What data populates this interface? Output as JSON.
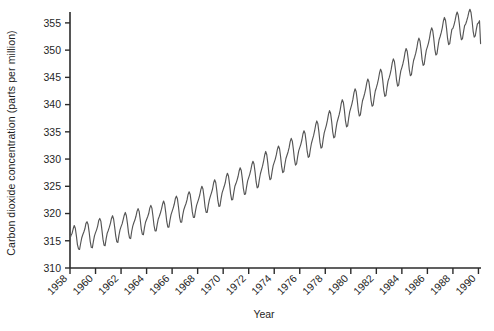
{
  "chart_data": {
    "type": "line",
    "title": "",
    "xlabel": "Year",
    "ylabel": "Carbon dioxide concentration (parts per million)",
    "xlim": [
      1958,
      1990.2
    ],
    "ylim": [
      310,
      357
    ],
    "grid": false,
    "legend": "none",
    "line_color": "#555555",
    "axis_color": "#2b2b2b",
    "background": "#ffffff",
    "ytick_labels": [
      "310",
      "315",
      "320",
      "325",
      "330",
      "335",
      "340",
      "345",
      "350",
      "355"
    ],
    "ytick_values": [
      310,
      315,
      320,
      325,
      330,
      335,
      340,
      345,
      350,
      355
    ],
    "xtick_labels": [
      "1958",
      "1960",
      "1962",
      "1964",
      "1966",
      "1968",
      "1970",
      "1972",
      "1974",
      "1976",
      "1978",
      "1980",
      "1982",
      "1984",
      "1986",
      "1988",
      "1990"
    ],
    "xtick_values": [
      1958,
      1960,
      1962,
      1964,
      1966,
      1968,
      1970,
      1972,
      1974,
      1976,
      1978,
      1980,
      1982,
      1984,
      1986,
      1988,
      1990
    ],
    "series": [
      {
        "name": "Atmospheric CO2 (Mauna Loa)",
        "description": "Monthly mean CO2 concentration showing a rising trend with an annual seasonal oscillation of roughly +/- 3 ppm",
        "x": [
          1958.0,
          1958.083,
          1958.167,
          1958.25,
          1958.333,
          1958.417,
          1958.5,
          1958.583,
          1958.667,
          1958.75,
          1958.833,
          1958.917,
          1959.0,
          1959.083,
          1959.167,
          1959.25,
          1959.333,
          1959.417,
          1959.5,
          1959.583,
          1959.667,
          1959.75,
          1959.833,
          1959.917,
          1960.0,
          1960.083,
          1960.167,
          1960.25,
          1960.333,
          1960.417,
          1960.5,
          1960.583,
          1960.667,
          1960.75,
          1960.833,
          1960.917,
          1961.0,
          1961.083,
          1961.167,
          1961.25,
          1961.333,
          1961.417,
          1961.5,
          1961.583,
          1961.667,
          1961.75,
          1961.833,
          1961.917,
          1962.0,
          1962.083,
          1962.167,
          1962.25,
          1962.333,
          1962.417,
          1962.5,
          1962.583,
          1962.667,
          1962.75,
          1962.833,
          1962.917,
          1963.0,
          1963.083,
          1963.167,
          1963.25,
          1963.333,
          1963.417,
          1963.5,
          1963.583,
          1963.667,
          1963.75,
          1963.833,
          1963.917,
          1964.0,
          1964.083,
          1964.167,
          1964.25,
          1964.333,
          1964.417,
          1964.5,
          1964.583,
          1964.667,
          1964.75,
          1964.833,
          1964.917,
          1965.0,
          1965.083,
          1965.167,
          1965.25,
          1965.333,
          1965.417,
          1965.5,
          1965.583,
          1965.667,
          1965.75,
          1965.833,
          1965.917,
          1966.0,
          1966.083,
          1966.167,
          1966.25,
          1966.333,
          1966.417,
          1966.5,
          1966.583,
          1966.667,
          1966.75,
          1966.833,
          1966.917,
          1967.0,
          1967.083,
          1967.167,
          1967.25,
          1967.333,
          1967.417,
          1967.5,
          1967.583,
          1967.667,
          1967.75,
          1967.833,
          1967.917,
          1968.0,
          1968.083,
          1968.167,
          1968.25,
          1968.333,
          1968.417,
          1968.5,
          1968.583,
          1968.667,
          1968.75,
          1968.833,
          1968.917,
          1969.0,
          1969.083,
          1969.167,
          1969.25,
          1969.333,
          1969.417,
          1969.5,
          1969.583,
          1969.667,
          1969.75,
          1969.833,
          1969.917,
          1970.0,
          1970.083,
          1970.167,
          1970.25,
          1970.333,
          1970.417,
          1970.5,
          1970.583,
          1970.667,
          1970.75,
          1970.833,
          1970.917,
          1971.0,
          1971.083,
          1971.167,
          1971.25,
          1971.333,
          1971.417,
          1971.5,
          1971.583,
          1971.667,
          1971.75,
          1971.833,
          1971.917,
          1972.0,
          1972.083,
          1972.167,
          1972.25,
          1972.333,
          1972.417,
          1972.5,
          1972.583,
          1972.667,
          1972.75,
          1972.833,
          1972.917,
          1973.0,
          1973.083,
          1973.167,
          1973.25,
          1973.333,
          1973.417,
          1973.5,
          1973.583,
          1973.667,
          1973.75,
          1973.833,
          1973.917,
          1974.0,
          1974.083,
          1974.167,
          1974.25,
          1974.333,
          1974.417,
          1974.5,
          1974.583,
          1974.667,
          1974.75,
          1974.833,
          1974.917,
          1975.0,
          1975.083,
          1975.167,
          1975.25,
          1975.333,
          1975.417,
          1975.5,
          1975.583,
          1975.667,
          1975.75,
          1975.833,
          1975.917,
          1976.0,
          1976.083,
          1976.167,
          1976.25,
          1976.333,
          1976.417,
          1976.5,
          1976.583,
          1976.667,
          1976.75,
          1976.833,
          1976.917,
          1977.0,
          1977.083,
          1977.167,
          1977.25,
          1977.333,
          1977.417,
          1977.5,
          1977.583,
          1977.667,
          1977.75,
          1977.833,
          1977.917,
          1978.0,
          1978.083,
          1978.167,
          1978.25,
          1978.333,
          1978.417,
          1978.5,
          1978.583,
          1978.667,
          1978.75,
          1978.833,
          1978.917,
          1979.0,
          1979.083,
          1979.167,
          1979.25,
          1979.333,
          1979.417,
          1979.5,
          1979.583,
          1979.667,
          1979.75,
          1979.833,
          1979.917,
          1980.0,
          1980.083,
          1980.167,
          1980.25,
          1980.333,
          1980.417,
          1980.5,
          1980.583,
          1980.667,
          1980.75,
          1980.833,
          1980.917,
          1981.0,
          1981.083,
          1981.167,
          1981.25,
          1981.333,
          1981.417,
          1981.5,
          1981.583,
          1981.667,
          1981.75,
          1981.833,
          1981.917,
          1982.0,
          1982.083,
          1982.167,
          1982.25,
          1982.333,
          1982.417,
          1982.5,
          1982.583,
          1982.667,
          1982.75,
          1982.833,
          1982.917,
          1983.0,
          1983.083,
          1983.167,
          1983.25,
          1983.333,
          1983.417,
          1983.5,
          1983.583,
          1983.667,
          1983.75,
          1983.833,
          1983.917,
          1984.0,
          1984.083,
          1984.167,
          1984.25,
          1984.333,
          1984.417,
          1984.5,
          1984.583,
          1984.667,
          1984.75,
          1984.833,
          1984.917,
          1985.0,
          1985.083,
          1985.167,
          1985.25,
          1985.333,
          1985.417,
          1985.5,
          1985.583,
          1985.667,
          1985.75,
          1985.833,
          1985.917,
          1986.0,
          1986.083,
          1986.167,
          1986.25,
          1986.333,
          1986.417,
          1986.5,
          1986.583,
          1986.667,
          1986.75,
          1986.833,
          1986.917,
          1987.0,
          1987.083,
          1987.167,
          1987.25,
          1987.333,
          1987.417,
          1987.5,
          1987.583,
          1987.667,
          1987.75,
          1987.833,
          1987.917,
          1988.0,
          1988.083,
          1988.167,
          1988.25,
          1988.333,
          1988.417,
          1988.5,
          1988.583,
          1988.667,
          1988.75,
          1988.833,
          1988.917,
          1989.0,
          1989.083,
          1989.167,
          1989.25,
          1989.333,
          1989.417,
          1989.5,
          1989.583,
          1989.667,
          1989.75,
          1989.833,
          1989.917,
          1990.0,
          1990.083,
          1990.167
        ],
        "y": [
          315.4,
          316.0,
          316.4,
          317.2,
          317.8,
          317.3,
          315.9,
          314.3,
          313.5,
          313.4,
          314.5,
          315.5,
          316.1,
          316.6,
          317.2,
          318.2,
          318.5,
          318.0,
          316.6,
          314.9,
          313.8,
          313.7,
          314.9,
          315.9,
          316.5,
          317.0,
          317.7,
          318.7,
          319.1,
          318.6,
          317.0,
          315.3,
          314.2,
          314.1,
          315.4,
          316.4,
          316.9,
          317.5,
          318.2,
          319.1,
          319.6,
          319.0,
          317.5,
          315.9,
          314.8,
          314.7,
          316.0,
          317.0,
          317.6,
          318.1,
          318.9,
          319.7,
          320.2,
          319.6,
          318.2,
          316.5,
          315.5,
          315.4,
          316.7,
          317.7,
          318.3,
          318.8,
          319.5,
          320.4,
          320.9,
          320.4,
          318.9,
          317.2,
          316.2,
          316.1,
          317.4,
          318.4,
          318.9,
          319.4,
          320.0,
          321.0,
          321.5,
          321.0,
          319.5,
          317.8,
          316.8,
          316.8,
          318.0,
          319.0,
          319.5,
          320.1,
          320.8,
          321.7,
          322.3,
          321.7,
          320.2,
          318.5,
          317.5,
          317.5,
          318.8,
          319.8,
          320.4,
          321.0,
          321.7,
          322.7,
          323.2,
          322.7,
          321.2,
          319.4,
          318.4,
          318.4,
          319.7,
          320.7,
          321.3,
          321.8,
          322.5,
          323.5,
          324.0,
          323.5,
          322.0,
          320.3,
          319.3,
          319.3,
          320.5,
          321.5,
          322.1,
          322.7,
          323.4,
          324.4,
          325.0,
          324.5,
          323.0,
          321.2,
          320.2,
          320.2,
          321.5,
          322.5,
          323.2,
          323.8,
          324.5,
          325.6,
          326.2,
          325.7,
          324.2,
          322.4,
          321.3,
          321.4,
          322.7,
          323.8,
          324.4,
          325.0,
          325.7,
          326.8,
          327.4,
          326.9,
          325.4,
          323.6,
          322.5,
          322.6,
          323.9,
          325.0,
          325.5,
          326.1,
          326.8,
          327.8,
          328.4,
          327.9,
          326.4,
          324.6,
          323.5,
          323.6,
          324.9,
          326.0,
          326.6,
          327.2,
          328.0,
          329.0,
          329.6,
          329.1,
          327.6,
          325.8,
          324.7,
          324.9,
          326.2,
          327.3,
          328.0,
          328.7,
          329.6,
          330.7,
          331.4,
          330.8,
          329.2,
          327.3,
          326.2,
          326.4,
          327.7,
          328.8,
          329.4,
          330.0,
          330.8,
          331.8,
          332.4,
          331.9,
          330.4,
          328.6,
          327.5,
          327.7,
          329.0,
          330.1,
          330.7,
          331.3,
          332.1,
          333.2,
          333.8,
          333.3,
          331.8,
          330.0,
          328.9,
          329.1,
          330.4,
          331.5,
          332.1,
          332.7,
          333.5,
          334.6,
          335.2,
          334.7,
          333.2,
          331.4,
          330.3,
          330.5,
          331.8,
          332.9,
          333.6,
          334.3,
          335.2,
          336.3,
          337.0,
          336.5,
          335.0,
          333.1,
          332.0,
          332.2,
          333.6,
          334.8,
          335.5,
          336.2,
          337.1,
          338.2,
          338.9,
          338.4,
          336.9,
          335.0,
          333.9,
          334.1,
          335.5,
          336.7,
          337.4,
          338.1,
          339.0,
          340.2,
          340.9,
          340.4,
          338.9,
          337.0,
          335.9,
          336.1,
          337.5,
          338.7,
          339.4,
          340.1,
          341.0,
          342.2,
          342.9,
          342.4,
          340.9,
          339.0,
          337.9,
          338.1,
          339.5,
          340.7,
          341.3,
          342.0,
          342.9,
          344.0,
          344.7,
          344.2,
          342.7,
          340.8,
          339.7,
          339.9,
          341.3,
          342.5,
          343.1,
          343.8,
          344.7,
          345.8,
          346.5,
          346.0,
          344.5,
          342.6,
          341.5,
          341.7,
          343.1,
          344.3,
          344.9,
          345.6,
          346.5,
          347.7,
          348.4,
          347.9,
          346.4,
          344.5,
          343.4,
          343.6,
          345.0,
          346.2,
          346.8,
          347.5,
          348.4,
          349.6,
          350.3,
          349.8,
          348.3,
          346.4,
          345.3,
          345.5,
          346.9,
          348.1,
          348.7,
          349.4,
          350.3,
          351.5,
          352.2,
          351.7,
          350.2,
          348.3,
          347.2,
          347.4,
          348.8,
          350.0,
          350.6,
          351.3,
          352.2,
          353.4,
          354.1,
          353.6,
          352.1,
          350.2,
          349.1,
          349.3,
          350.7,
          351.9,
          352.5,
          353.2,
          354.1,
          355.3,
          356.0,
          355.5,
          354.0,
          352.1,
          351.0,
          351.2,
          352.6,
          353.8,
          354.0,
          354.6,
          355.4,
          356.4,
          357.0,
          356.4,
          354.9,
          353.0,
          351.9,
          352.1,
          353.4,
          354.5,
          354.8,
          355.4,
          356.1,
          357.0,
          357.5,
          356.9,
          355.4,
          353.5,
          352.4,
          352.6,
          353.8,
          354.8,
          355.0,
          355.4,
          351.2
        ]
      }
    ]
  },
  "axis": {
    "ylabel": "Carbon dioxide concentration (parts per million)",
    "xlabel": "Year"
  }
}
